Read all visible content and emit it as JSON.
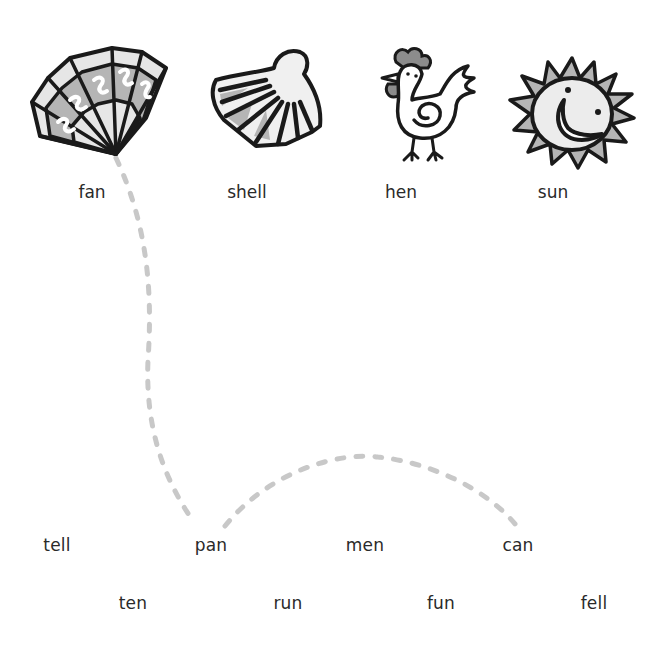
{
  "worksheet": {
    "pictures": [
      {
        "id": "fan",
        "label": "fan",
        "icon": "fan-icon"
      },
      {
        "id": "shell",
        "label": "shell",
        "icon": "shell-icon"
      },
      {
        "id": "hen",
        "label": "hen",
        "icon": "hen-icon"
      },
      {
        "id": "sun",
        "label": "sun",
        "icon": "sun-icon"
      }
    ],
    "words_row1": [
      "tell",
      "pan",
      "men",
      "can"
    ],
    "words_row2": [
      "ten",
      "run",
      "fun",
      "fell"
    ],
    "example_path": {
      "from": "fan",
      "through": [
        "pan",
        "can"
      ],
      "stroke_color": "#c8c8c8"
    }
  },
  "colors": {
    "outline": "#1a1a1a",
    "light_fill": "#e6e6e6",
    "mid_fill": "#b5b5b5",
    "dark_fill": "#8c8c8c",
    "text": "#2a2a2a",
    "path": "#c8c8c8"
  }
}
